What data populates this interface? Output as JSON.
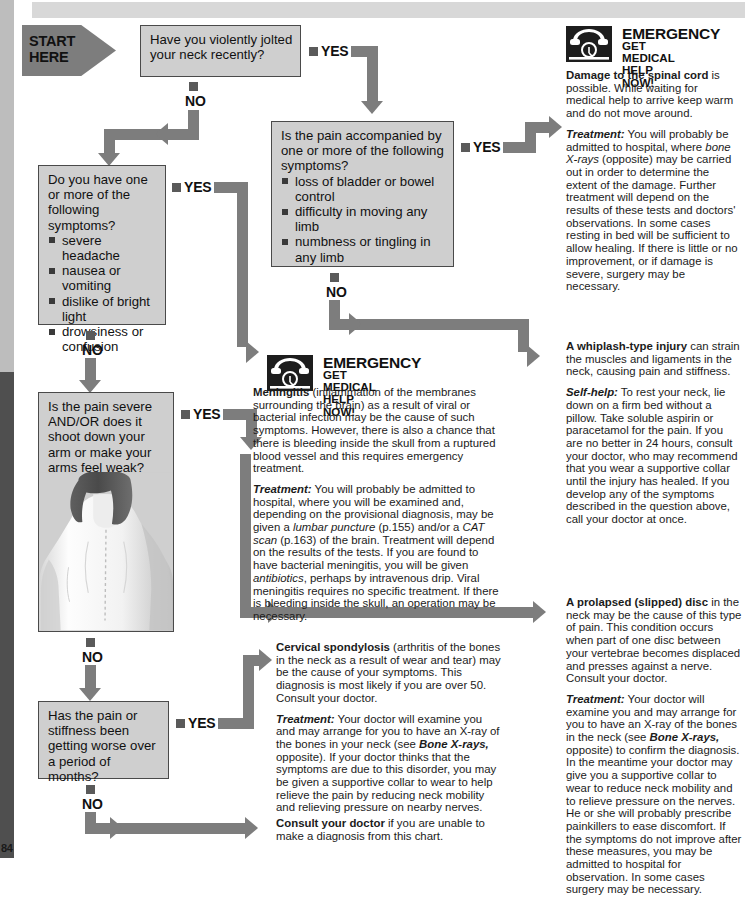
{
  "page": {
    "page_number": "84",
    "start_label_line1": "START",
    "start_label_line2": "HERE"
  },
  "labels": {
    "yes": "YES",
    "no": "NO"
  },
  "questions": [
    {
      "id": "q-jolted-neck",
      "text": "Have you violently jolted your neck recently?",
      "bullets": []
    },
    {
      "id": "q-accompanying-symptoms",
      "text": "Is the pain accompanied by one or more of the following symptoms?",
      "bullets": [
        "loss of bladder or bowel control",
        "difficulty in moving any limb",
        "numbness or tingling in any limb"
      ]
    },
    {
      "id": "q-other-symptoms",
      "text": "Do you have one or more of the following symptoms?",
      "bullets": [
        "severe headache",
        "nausea or vomiting",
        "dislike of bright light",
        "drowsiness or confusion"
      ]
    },
    {
      "id": "q-severe-pain",
      "text": "Is the pain severe AND/OR does it shoot down your arm or make your arms feel weak?",
      "bullets": []
    },
    {
      "id": "q-getting-worse",
      "text": "Has the pain or stiffness been getting worse over a period of months?",
      "bullets": []
    }
  ],
  "emergency_spinal": {
    "title": "EMERGENCY",
    "subtitle_line1": "GET MEDICAL",
    "subtitle_line2": "HELP NOW!",
    "icon": "telephone-icon",
    "para1_bold": "Damage to the spinal cord",
    "para1_rest": " is possible. While waiting for medical help to arrive keep warm and do not move around.",
    "para2_lead": "Treatment:",
    "para2_a": " You will probably be admitted to hospital, where ",
    "para2_italic1": "bone X-rays",
    "para2_b": " (opposite) may be carried out in order to determine the extent of the damage. Further treatment will depend on the results of these tests and doctors' observations. In some cases resting in bed will be sufficient to allow healing. If there is little or no improvement, or if damage is severe, surgery may be necessary."
  },
  "emergency_meningitis": {
    "title": "EMERGENCY",
    "subtitle_line1": "GET MEDICAL",
    "subtitle_line2": "HELP NOW!",
    "icon": "telephone-icon",
    "para1_bold": "Meningitis",
    "para1_rest": " (inflammation of the membranes surrounding the brain) as a result of viral or bacterial infection may be the cause of such symptoms. However, there is also a chance that there is bleeding inside the skull from a ruptured blood vessel and this requires emergency treatment.",
    "para2_lead": "Treatment:",
    "para2_a": " You will probably be admitted to hospital, where you will be examined and, depending on the provisional diagnosis, may be given a ",
    "para2_italic1": "lumbar puncture",
    "para2_b": " (p.155) and/or a ",
    "para2_italic2": "CAT scan",
    "para2_c": " (p.163) of the brain. Treatment will depend on the results of the tests. If you are found to have bacterial meningitis, you will be given ",
    "para2_italic3": "antibiotics",
    "para2_d": ", perhaps by intravenous drip. Viral meningitis requires no specific treatment. If there is bleeding inside the skull, an operation may be necessary."
  },
  "whiplash": {
    "para1_bold": "A whiplash-type injury",
    "para1_rest": " can strain the muscles and ligaments in the neck, causing pain and stiffness.",
    "para2_lead": "Self-help:",
    "para2_rest": " To rest your neck, lie down on a firm bed without a pillow. Take soluble aspirin or paracetamol for the pain. If you are no better in 24 hours, consult your doctor, who may recommend that you wear a supportive collar until the injury has healed. If you develop any of the symptoms described in the question above, call your doctor at once."
  },
  "prolapsed_disc": {
    "para1_bold": "A prolapsed (slipped) disc",
    "para1_rest": " in the neck may be the cause of this type of pain. This condition occurs when part of one disc between your vertebrae becomes displaced and presses against a nerve. Consult your doctor.",
    "para2_lead": "Treatment:",
    "para2_a": " Your doctor will examine you and may arrange for you to have an X-ray of the bones in the neck (see ",
    "para2_italic1": "Bone X-rays,",
    "para2_b": " opposite) to confirm the diagnosis. In the meantime your doctor may give you a supportive collar to wear to reduce neck mobility and to relieve pressure on the nerves. He or she will probably prescribe painkillers to ease discomfort. If the symptoms do not improve after these measures, you may be admitted to hospital for observation. In some cases surgery may be necessary."
  },
  "cervical_spondylosis": {
    "para1_bold": "Cervical spondylosis",
    "para1_rest": " (arthritis of the bones in the neck as a result of wear and tear) may be the cause of your symptoms. This diagnosis is most likely if you are over 50. Consult your doctor.",
    "para2_lead": "Treatment:",
    "para2_a": " Your doctor will examine you and may arrange for you to have an X-ray of the bones in your neck (see ",
    "para2_italic1": "Bone X-rays,",
    "para2_b": " opposite). If your doctor thinks that the symptoms are due to this disorder, you may be given a supportive collar to wear to help relieve the pain by reducing neck mobility and relieving pressure on nearby nerves."
  },
  "consult": {
    "bold": "Consult your doctor",
    "rest": " if you are unable to make a diagnosis from this chart."
  },
  "figure": {
    "caption": "woman-back-illustration"
  },
  "colors": {
    "box_fill": "#cfcfcf",
    "box_border": "#4a4a4a",
    "arrow": "#7d7d7d",
    "marker": "#5a5a5a",
    "text": "#111111",
    "header_bar": "#d8d8d8",
    "edge_bar": "#bdbdbd",
    "edge_bar_dark": "#4f4f4f"
  }
}
